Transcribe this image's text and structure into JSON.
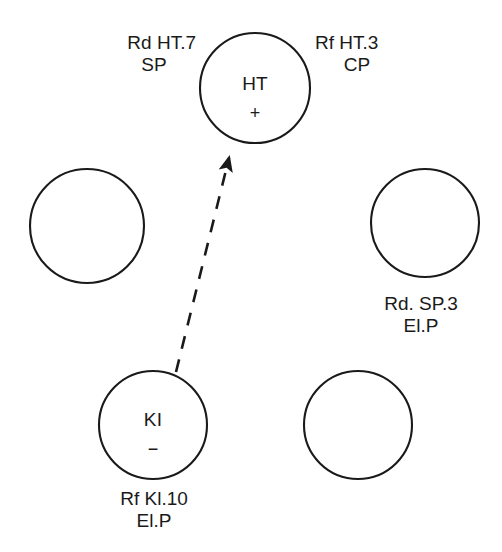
{
  "diagram": {
    "type": "node-link-diagram",
    "background_color": "#ffffff",
    "stroke_color": "#1a1a1a",
    "text_color": "#1a1a1a",
    "nodes": [
      {
        "id": "ht",
        "name": "node-ht",
        "label": "HT",
        "sign": "+",
        "cx": 255,
        "cy": 88,
        "r": 55,
        "filled": false
      },
      {
        "id": "left-middle",
        "name": "node-left-middle",
        "label": "",
        "sign": "",
        "cx": 87,
        "cy": 226,
        "r": 57,
        "filled": false
      },
      {
        "id": "right-middle",
        "name": "node-right-middle",
        "label": "",
        "sign": "",
        "cx": 425,
        "cy": 223,
        "r": 54,
        "filled": false
      },
      {
        "id": "ki",
        "name": "node-ki",
        "label": "KI",
        "sign": "−",
        "cx": 153,
        "cy": 425,
        "r": 54,
        "filled": false
      },
      {
        "id": "bottom-right",
        "name": "node-bottom-right",
        "label": "",
        "sign": "",
        "cx": 358,
        "cy": 425,
        "r": 54,
        "filled": false
      }
    ],
    "annotations": [
      {
        "id": "annot-rd-ht7",
        "name": "annotation-rd-ht7-sp",
        "line1": "Rd HT.7",
        "line2": "SP",
        "x": 112,
        "y": 32,
        "width": 84,
        "align": "right"
      },
      {
        "id": "annot-rf-ht3",
        "name": "annotation-rf-ht3-cp",
        "line1": "Rf HT.3",
        "line2": "CP",
        "x": 315,
        "y": 32,
        "width": 84,
        "align": "left"
      },
      {
        "id": "annot-rd-sp3",
        "name": "annotation-rd-sp3-elp",
        "line1": "Rd. SP.3",
        "line2": "El.P",
        "x": 367,
        "y": 293,
        "width": 108,
        "align": "center"
      },
      {
        "id": "annot-rf-ki10",
        "name": "annotation-rf-ki10-elp",
        "line1": "Rf Kl.10",
        "line2": "El.P",
        "x": 99,
        "y": 488,
        "width": 110,
        "align": "center"
      }
    ],
    "edges": [
      {
        "id": "edge-ki-to-ht",
        "name": "dashed-arrow-ki-to-ht",
        "from": "ki",
        "to": "ht",
        "style": "dashed",
        "arrowhead": "filled-triangle",
        "x1": 176,
        "y1": 372,
        "x2": 229,
        "y2": 158
      }
    ]
  }
}
